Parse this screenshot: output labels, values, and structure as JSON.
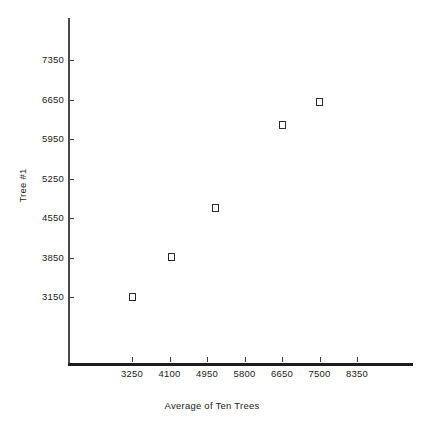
{
  "chart_data": {
    "type": "scatter",
    "title": "",
    "xlabel": "Average of Ten Trees",
    "ylabel": "Tree #1",
    "xticks": [
      "3250",
      "4100",
      "4950",
      "5800",
      "6650",
      "7500",
      "8350"
    ],
    "yticks": [
      "7350",
      "6650",
      "5950",
      "5250",
      "4550",
      "3850",
      "3150"
    ],
    "xlim": [
      2825,
      9250
    ],
    "ylim": [
      2625,
      7800
    ],
    "grid": false,
    "legend": null,
    "marker": "open-square",
    "marker_color": "#2a2a2a",
    "points": [
      {
        "x": 3250,
        "y": 3150
      },
      {
        "x": 4150,
        "y": 3860
      },
      {
        "x": 5150,
        "y": 4720
      },
      {
        "x": 6650,
        "y": 6200
      },
      {
        "x": 7500,
        "y": 6610
      }
    ],
    "series": [
      {
        "name": "Tree #1 vs Average of Ten Trees",
        "x": [
          3250,
          4150,
          5150,
          6650,
          7500
        ],
        "values": [
          3150,
          3860,
          4720,
          6200,
          6610
        ]
      }
    ]
  },
  "axes": {
    "x_title": "Average of Ten Trees",
    "y_title": "Tree #1"
  }
}
